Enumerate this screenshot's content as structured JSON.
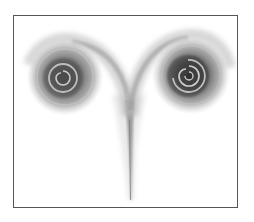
{
  "illustration": {
    "subject": "two-grey-spirals-on-stem",
    "background": "#ffffff",
    "frame": {
      "border_color": "#555555",
      "x": 13,
      "y": 15,
      "width": 223,
      "height": 191
    },
    "colors": {
      "outer_halo": "#d4d4d4",
      "mid_ring": "#a8a8a8",
      "dark_ring": "#5a5a5a",
      "core": "#3a3a3a",
      "highlight": "#e6e6e6",
      "stem": "#8c8c8c"
    },
    "left_spiral": {
      "cx": 65,
      "cy": 77,
      "r": 36
    },
    "right_spiral": {
      "cx": 191,
      "cy": 75,
      "r": 38
    },
    "stem": {
      "top_x": 129,
      "top_y": 100,
      "bottom_x": 131,
      "bottom_y": 200
    }
  }
}
